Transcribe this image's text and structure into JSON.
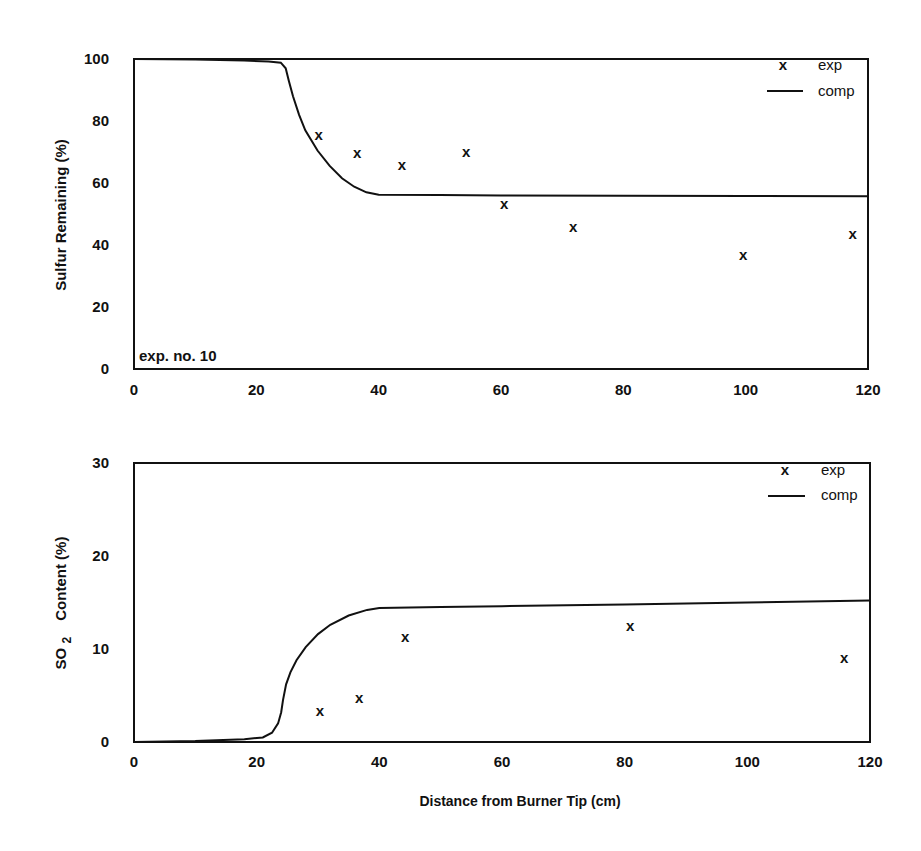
{
  "chart_data": [
    {
      "type": "line",
      "title": "",
      "annotation": "exp. no. 10",
      "xlabel": "",
      "ylabel": "Sulfur   Remaining  (%)",
      "xlim": [
        0,
        120
      ],
      "ylim": [
        0,
        100
      ],
      "xticks": [
        0,
        20,
        40,
        60,
        80,
        100,
        120
      ],
      "yticks": [
        0,
        20,
        40,
        60,
        80,
        100
      ],
      "grid": false,
      "legend_position": "upper right",
      "legend": [
        {
          "symbol": "x",
          "label": "exp"
        },
        {
          "symbol": "line",
          "label": "comp"
        }
      ],
      "series": [
        {
          "name": "exp",
          "kind": "scatter",
          "marker": "x",
          "x": [
            30.2,
            36.5,
            43.8,
            54.3,
            60.5,
            71.8,
            99.6,
            117.5
          ],
          "y": [
            75.5,
            69.7,
            65.8,
            70.0,
            53.2,
            45.8,
            36.8,
            43.5
          ]
        },
        {
          "name": "comp",
          "kind": "line",
          "x": [
            0,
            10,
            18,
            22,
            24,
            24.8,
            25.3,
            26,
            27,
            28,
            30,
            32,
            34,
            36,
            38,
            40,
            50,
            60,
            80,
            100,
            120
          ],
          "y": [
            100,
            99.8,
            99.5,
            99.2,
            98.8,
            97,
            93,
            88,
            82,
            77,
            70.5,
            65.5,
            61.5,
            58.8,
            57,
            56.2,
            56.1,
            56,
            55.9,
            55.8,
            55.7
          ]
        }
      ]
    },
    {
      "type": "line",
      "title": "",
      "xlabel": "Distance  from  Burner  Tip (cm)",
      "ylabel_main": "SO",
      "ylabel_sub": "2",
      "ylabel_rest": "Content  (%)",
      "xlim": [
        0,
        120
      ],
      "ylim": [
        0,
        30
      ],
      "xticks": [
        0,
        20,
        40,
        60,
        80,
        100,
        120
      ],
      "yticks": [
        0,
        10,
        20,
        30
      ],
      "grid": false,
      "legend_position": "upper right",
      "legend": [
        {
          "symbol": "x",
          "label": "exp"
        },
        {
          "symbol": "line",
          "label": "comp"
        }
      ],
      "series": [
        {
          "name": "exp",
          "kind": "scatter",
          "marker": "x",
          "x": [
            30.3,
            36.7,
            44.2,
            80.9,
            115.8
          ],
          "y": [
            3.3,
            4.7,
            11.3,
            12.5,
            9.0
          ]
        },
        {
          "name": "comp",
          "kind": "line",
          "x": [
            0,
            10,
            18,
            21,
            22.5,
            23.5,
            24,
            24.3,
            24.8,
            25.5,
            26.5,
            28,
            30,
            32,
            35,
            38,
            40,
            50,
            60,
            80,
            100,
            120
          ],
          "y": [
            0,
            0.1,
            0.3,
            0.5,
            1.0,
            2.0,
            3.2,
            4.5,
            6.2,
            7.5,
            8.8,
            10.2,
            11.6,
            12.6,
            13.6,
            14.2,
            14.4,
            14.5,
            14.6,
            14.8,
            15.0,
            15.2
          ]
        }
      ]
    }
  ],
  "labels": {
    "top_ylabel": "Sulfur   Remaining  (%)",
    "top_annotation": "exp. no. 10",
    "bottom_ylabel_so": "SO",
    "bottom_ylabel_sub": "2",
    "bottom_ylabel_rest": "Content  (%)",
    "xlabel": "Distance  from  Burner  Tip (cm)",
    "legend_exp_symbol": "x",
    "legend_exp": "exp",
    "legend_comp": "comp"
  }
}
